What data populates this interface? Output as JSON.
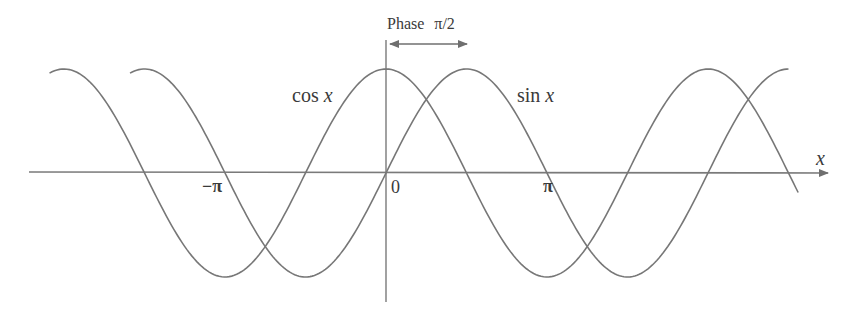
{
  "chart_data": {
    "type": "line",
    "title": "",
    "xlabel": "x",
    "ylabel": "",
    "grid": false,
    "legend": "inline labels",
    "tick_labels": {
      "neg_pi": "−π",
      "zero": "0",
      "pi": "π"
    },
    "x_ticks": [
      -3.14159,
      0,
      3.14159
    ],
    "x_range_radians": [
      -6.57,
      8.06
    ],
    "y_range": [
      -1.25,
      1.25
    ],
    "series": [
      {
        "name": "cos x",
        "label": "cos x",
        "function": "cos",
        "x_start_pi": -2.09,
        "x_end_pi": 2.56
      },
      {
        "name": "sin x",
        "label": "sin x",
        "function": "sin",
        "x_start_pi": -1.59,
        "x_end_pi": 2.5
      }
    ],
    "annotations": [
      {
        "text": "Phase π/2",
        "type": "double-arrow",
        "from_x_pi": 0,
        "to_x_pi": 0.5
      }
    ]
  },
  "labels": {
    "cos": "cos ",
    "sin": "sin ",
    "var": "x",
    "x_axis": "x",
    "neg_pi": "−π",
    "zero": "0",
    "pi": "π",
    "phase_word": "Phase",
    "phase_value": "π/2"
  },
  "colors": {
    "curve": "#777777",
    "axis": "#7a7a7a",
    "text": "#3a3a3a"
  }
}
